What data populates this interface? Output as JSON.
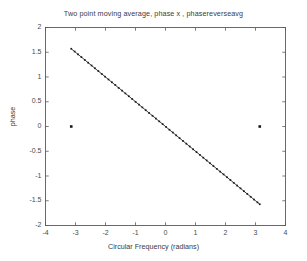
{
  "figure": {
    "background_color": "#ffffff",
    "axes_color": "#5a5a5a",
    "data_color": "#1a1a1a"
  },
  "chart_data": {
    "type": "scatter",
    "title": "Two point moving average, phase  x , phasereverseavg",
    "xlabel": "Circular Frequency  (radians)",
    "ylabel": "phase",
    "xlim": [
      -4,
      4
    ],
    "ylim": [
      -2,
      2
    ],
    "xticks": [
      -4,
      -3,
      -2,
      -1,
      0,
      1,
      2,
      3,
      4
    ],
    "xticklabels": [
      "-4",
      "-3",
      "-2",
      "-1",
      "0",
      "1",
      "2",
      "3",
      "4"
    ],
    "yticks": [
      -2,
      -1.5,
      -1,
      -0.5,
      0,
      0.5,
      1,
      1.5,
      2
    ],
    "yticklabels": [
      "-2",
      "-1.5",
      "-1",
      "-0.5",
      "0",
      "0.5",
      "1",
      "1.5",
      "2"
    ],
    "grid": false,
    "legend": null,
    "series": [
      {
        "name": "phase",
        "marker": "dot",
        "linestyle": "solid",
        "x": [
          -3.1416,
          -3.0287,
          -2.9159,
          -2.803,
          -2.6902,
          -2.5774,
          -2.4645,
          -2.3517,
          -2.2388,
          -2.126,
          -2.0132,
          -1.9003,
          -1.7875,
          -1.6746,
          -1.5618,
          -1.449,
          -1.3361,
          -1.2233,
          -1.1104,
          -0.9976,
          -0.8848,
          -0.7719,
          -0.6591,
          -0.5462,
          -0.4334,
          -0.3206,
          -0.2077,
          -0.0949,
          0.018,
          0.1308,
          0.2436,
          0.3565,
          0.4693,
          0.5822,
          0.695,
          0.8078,
          0.9207,
          1.0335,
          1.1464,
          1.2592,
          1.372,
          1.4849,
          1.5977,
          1.7106,
          1.8234,
          1.9362,
          2.0491,
          2.1619,
          2.2748,
          2.3876,
          2.5004,
          2.6133,
          2.7261,
          2.839,
          2.9518,
          3.0646,
          3.1416
        ],
        "y": [
          1.5708,
          1.5143,
          1.458,
          1.4015,
          1.3451,
          1.2887,
          1.2323,
          1.1759,
          1.1194,
          1.063,
          1.0066,
          0.9502,
          0.8938,
          0.8373,
          0.7809,
          0.7245,
          0.6681,
          0.6117,
          0.5552,
          0.4988,
          0.4424,
          0.386,
          0.3296,
          0.2731,
          0.2167,
          0.1603,
          0.1039,
          0.0475,
          -0.009,
          -0.0654,
          -0.1218,
          -0.1783,
          -0.2347,
          -0.2911,
          -0.3475,
          -0.4039,
          -0.4604,
          -0.5168,
          -0.5732,
          -0.6296,
          -0.686,
          -0.7425,
          -0.7989,
          -0.8553,
          -0.9117,
          -0.9681,
          -1.0246,
          -1.081,
          -1.1374,
          -1.1938,
          -1.2502,
          -1.3067,
          -1.3631,
          -1.4195,
          -1.4759,
          -1.5323,
          -1.5708
        ]
      },
      {
        "name": "phasereverseavg",
        "marker": "dot",
        "linestyle": "none",
        "x": [
          -3.1416,
          3.1416
        ],
        "y": [
          0,
          0
        ]
      }
    ],
    "annotations": []
  }
}
